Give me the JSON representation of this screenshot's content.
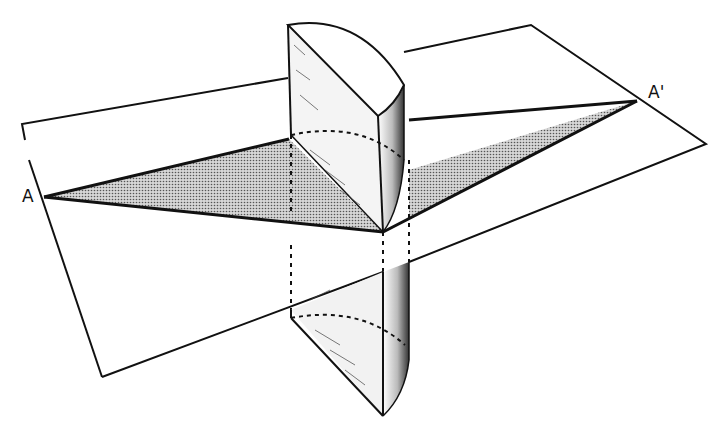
{
  "figure": {
    "colors": {
      "ink": "#111111",
      "background": "#ffffff",
      "section_fill": "#b8b8b8"
    }
  },
  "labels": {
    "point_a": "A",
    "point_a_prime": "A'"
  },
  "geometry": {
    "plane": [
      [
        22,
        124
      ],
      [
        531,
        25
      ],
      [
        706,
        144
      ],
      [
        102,
        377
      ]
    ],
    "section_triangle": [
      [
        44,
        197
      ],
      [
        637,
        101
      ],
      [
        383,
        232
      ]
    ],
    "cylinder_axis_top": [
      378,
      116
    ],
    "cylinder_axis_bottom": [
      383,
      416
    ]
  }
}
